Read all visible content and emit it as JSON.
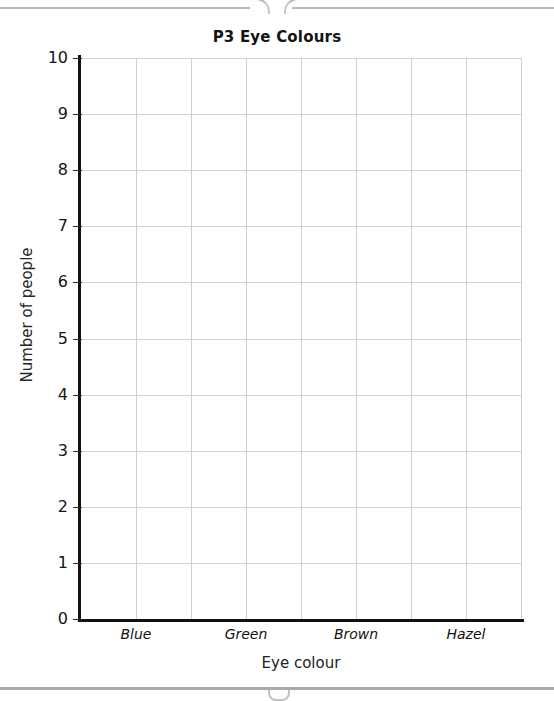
{
  "chrome": {
    "top_tab_strip": "browser-tab-strip-edge",
    "bottom_rule": "page-footer-rule",
    "bottom_nub": "scroll-indicator-nub"
  },
  "chart_data": {
    "type": "bar",
    "title": "P3 Eye Colours",
    "xlabel": "Eye colour",
    "ylabel": "Number of people",
    "categories": [
      "Blue",
      "Green",
      "Brown",
      "Hazel"
    ],
    "values": [
      null,
      null,
      null,
      null
    ],
    "ylim": [
      0,
      10
    ],
    "y_ticks": [
      0,
      1,
      2,
      3,
      4,
      5,
      6,
      7,
      8,
      9,
      10
    ],
    "y_tick_labels": [
      "0",
      "1",
      "2",
      "3",
      "4",
      "5",
      "6",
      "7",
      "8",
      "9",
      "10"
    ],
    "grid": true,
    "grid_columns": 8,
    "legend": null,
    "note": "Empty worksheet grid - no bars drawn",
    "colors": {
      "axis": "#111111",
      "gridline_horizontal": "#d2d2d2",
      "gridline_vertical": "#cfcfcf",
      "text": "#141414",
      "background": "#ffffff"
    }
  }
}
